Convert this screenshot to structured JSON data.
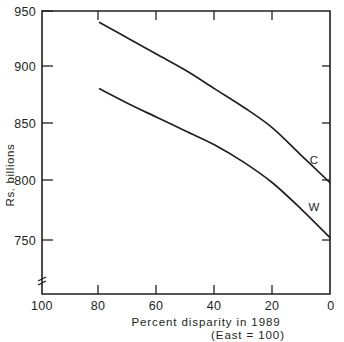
{
  "chart_data": {
    "type": "line",
    "title": "",
    "xlabel": "Percent disparity in 1989",
    "xlabel_sub": "(East = 100)",
    "ylabel": "Rs. billions",
    "xlim": [
      100,
      0
    ],
    "ylim": [
      740,
      950
    ],
    "x_reversed": true,
    "grid": false,
    "legend_position": "inline-right",
    "y_axis_break": true,
    "xticks": [
      "100",
      "80",
      "60",
      "40",
      "20",
      "0"
    ],
    "xtick_values": [
      100,
      80,
      60,
      40,
      20,
      0
    ],
    "yticks": [
      "950",
      "900",
      "850",
      "800",
      "750"
    ],
    "ytick_values": [
      950,
      900,
      850,
      800,
      750
    ],
    "series": [
      {
        "name": "C",
        "label": "C",
        "x": [
          80,
          70,
          60,
          50,
          40,
          30,
          20,
          10,
          0
        ],
        "values": [
          940,
          926,
          912,
          898,
          882,
          866,
          848,
          824,
          800
        ]
      },
      {
        "name": "W",
        "label": "W",
        "x": [
          80,
          70,
          60,
          50,
          40,
          30,
          20,
          10,
          0
        ],
        "values": [
          882,
          869,
          857,
          845,
          833,
          818,
          800,
          777,
          752
        ]
      }
    ]
  },
  "figure": {
    "y_axis_title": "Rs. billions",
    "x_axis_title": "Percent disparity in 1989",
    "x_axis_subtitle": "(East = 100)",
    "ytick_labels": [
      "950",
      "900",
      "850",
      "800",
      "750"
    ],
    "xtick_labels": [
      "100",
      "80",
      "60",
      "40",
      "20",
      "0"
    ],
    "series_labels": [
      "C",
      "W"
    ],
    "line_color": "#231f20",
    "background_color": "#ffffff"
  }
}
